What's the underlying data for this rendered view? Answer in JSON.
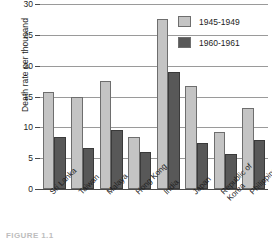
{
  "figure": {
    "caption": "FIGURE 1.1"
  },
  "chart_data": {
    "type": "bar",
    "title": "",
    "xlabel": "",
    "ylabel": "Death rate per thousand",
    "ylim": [
      0,
      30
    ],
    "yticks": [
      0,
      5,
      10,
      15,
      20,
      25,
      30
    ],
    "ytick_labels": [
      "0",
      "5",
      "10",
      "15",
      "20",
      "25",
      "30"
    ],
    "grid": true,
    "legend_position": "top-right",
    "categories": [
      "Sri Lanka",
      "Taiwan",
      "Malaya",
      "Hong Kong",
      "India",
      "Japan",
      "Republic of Korea",
      "Philippines"
    ],
    "series": [
      {
        "name": "1945-1949",
        "color": "#c4c4c4",
        "values": [
          15.8,
          15.0,
          17.5,
          8.5,
          27.5,
          16.7,
          9.3,
          13.1
        ]
      },
      {
        "name": "1960-1961",
        "color": "#585858",
        "values": [
          8.4,
          6.7,
          9.5,
          6.0,
          19.0,
          7.5,
          5.6,
          7.9
        ]
      }
    ]
  }
}
